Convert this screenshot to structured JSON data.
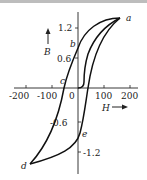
{
  "figure": {
    "axes": {
      "x_label": "H",
      "y_label": "B",
      "x_ticks": [
        "-200",
        "-100",
        "0",
        "100",
        "200"
      ],
      "y_ticks": [
        "1.2",
        "0.6",
        "-0.6",
        "-1.2"
      ]
    },
    "points": {
      "a": "a",
      "b": "b",
      "c": "c",
      "d": "d",
      "e": "e"
    },
    "colors": {
      "curve": "#111111",
      "axis": "#222222",
      "top_strip": "#bdbdbd"
    }
  }
}
